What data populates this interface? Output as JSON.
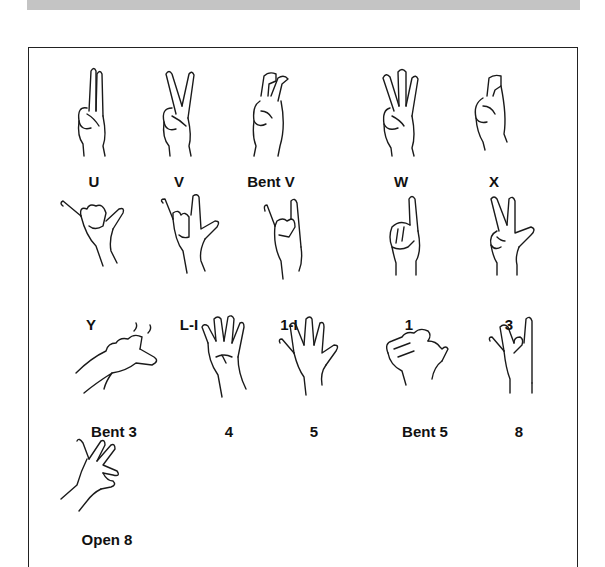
{
  "header_band": {
    "color": "#c4c4c4"
  },
  "handshapes": [
    {
      "label": "U",
      "icon": "hand-u-icon"
    },
    {
      "label": "V",
      "icon": "hand-v-icon"
    },
    {
      "label": "Bent V",
      "icon": "hand-bent-v-icon"
    },
    {
      "label": "W",
      "icon": "hand-w-icon"
    },
    {
      "label": "X",
      "icon": "hand-x-icon"
    },
    {
      "label": "Y",
      "icon": "hand-y-icon"
    },
    {
      "label": "L-I",
      "icon": "hand-l-i-icon"
    },
    {
      "label": "1-I",
      "icon": "hand-1-i-icon"
    },
    {
      "label": "1",
      "icon": "hand-1-icon"
    },
    {
      "label": "3",
      "icon": "hand-3-icon"
    },
    {
      "label": "Bent 3",
      "icon": "hand-bent-3-icon"
    },
    {
      "label": "4",
      "icon": "hand-4-icon"
    },
    {
      "label": "5",
      "icon": "hand-5-icon"
    },
    {
      "label": "Bent 5",
      "icon": "hand-bent-5-icon"
    },
    {
      "label": "8",
      "icon": "hand-8-icon"
    },
    {
      "label": "Open 8",
      "icon": "hand-open-8-icon"
    }
  ]
}
